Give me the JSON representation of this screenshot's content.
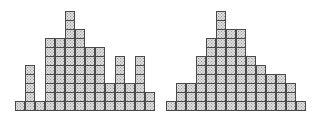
{
  "figure": {
    "background_color": "#ffffff",
    "cell_fill_color": "#dcdcdc",
    "cell_border_color": "#4a4a4a",
    "cell_stipple_color": "#9b9b9b",
    "cell_size_px": 10,
    "baseline_y_px": 121
  },
  "chart_data": [
    {
      "type": "bar",
      "name": "left-histogram",
      "title": "",
      "subtitle": "",
      "xlabel": "",
      "ylabel": "",
      "grid": true,
      "legend": "none",
      "unit": "squares",
      "description": "Irregular unit-square histogram, 14 columns, jagged profile peaking at column 6.",
      "categories": [
        "1",
        "2",
        "3",
        "4",
        "5",
        "6",
        "7",
        "8",
        "9",
        "10",
        "11",
        "12",
        "13",
        "14"
      ],
      "values": [
        1,
        5,
        1,
        8,
        8,
        11,
        9,
        7,
        7,
        3,
        6,
        3,
        6,
        2
      ],
      "ylim": [
        0,
        11
      ],
      "xlim": [
        0,
        14
      ],
      "max_value": 11,
      "min_value": 1,
      "total": 77,
      "column_count": 14
    },
    {
      "type": "bar",
      "name": "right-histogram",
      "title": "",
      "subtitle": "",
      "xlabel": "",
      "ylabel": "",
      "grid": true,
      "legend": "none",
      "unit": "squares",
      "description": "Smooth staircase unit-square histogram, 14 columns, symmetric-ish pyramid peaking at column 6.",
      "categories": [
        "1",
        "2",
        "3",
        "4",
        "5",
        "6",
        "7",
        "8",
        "9",
        "10",
        "11",
        "12",
        "13",
        "14"
      ],
      "values": [
        1,
        3,
        3,
        6,
        8,
        11,
        9,
        9,
        6,
        5,
        4,
        4,
        3,
        1
      ],
      "ylim": [
        0,
        11
      ],
      "xlim": [
        0,
        14
      ],
      "max_value": 11,
      "min_value": 1,
      "total": 73,
      "column_count": 14
    }
  ],
  "layout": {
    "left_chart_x_px": 15,
    "right_chart_x_px": 166,
    "chart_width_px": 140
  }
}
